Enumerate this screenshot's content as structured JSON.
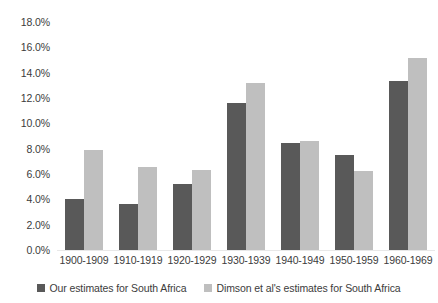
{
  "chart_data": {
    "type": "bar",
    "title": "",
    "subtitle": "",
    "xlabel": "",
    "ylabel": "",
    "grid": false,
    "legend_position": "bottom",
    "ylim": [
      0,
      18
    ],
    "ytick_step": 2,
    "ytick_labels": [
      "18.0%",
      "16.0%",
      "14.0%",
      "12.0%",
      "10.0%",
      "8.0%",
      "6.0%",
      "4.0%",
      "2.0%",
      "0.0%"
    ],
    "ytick_values": [
      18,
      16,
      14,
      12,
      10,
      8,
      6,
      4,
      2,
      0
    ],
    "categories": [
      "1900-1909",
      "1910-1919",
      "1920-1929",
      "1930-1939",
      "1940-1949",
      "1950-1959",
      "1960-1969"
    ],
    "series": [
      {
        "name": "Our estimates for South Africa",
        "color": "#595959",
        "values": [
          4.1,
          3.7,
          5.3,
          11.7,
          8.5,
          7.6,
          13.4
        ]
      },
      {
        "name": "Dimson et al's estimates for South Africa",
        "color": "#bfbfbf",
        "values": [
          8.0,
          6.6,
          6.4,
          13.3,
          8.7,
          6.3,
          15.2
        ]
      }
    ]
  }
}
